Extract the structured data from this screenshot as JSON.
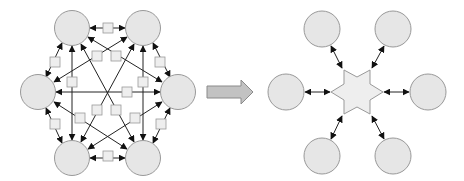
{
  "diagram": {
    "title": "",
    "colors": {
      "node_fill": "#e6e6e6",
      "node_stroke": "#999999",
      "edge": "#222222",
      "box_fill": "#eeeeee",
      "box_stroke": "#999999",
      "hub_fill": "#eeeeee",
      "arrow_fill": "#c2c2c2",
      "arrow_stroke": "#8a8a8a"
    },
    "left_panel": {
      "description": "Point-to-point mesh: 6 nodes, every pair connected by a bidirectional link with an intermediary box",
      "nodes": [
        {
          "id": "top-left",
          "x": 72,
          "y": 28
        },
        {
          "id": "top-right",
          "x": 143,
          "y": 28
        },
        {
          "id": "left",
          "x": 38,
          "y": 92
        },
        {
          "id": "right",
          "x": 178,
          "y": 92
        },
        {
          "id": "bottom-left",
          "x": 72,
          "y": 158
        },
        {
          "id": "bottom-right",
          "x": 143,
          "y": 158
        }
      ],
      "link_count": 15,
      "box_count": 15
    },
    "transition_arrow": {
      "direction": "right"
    },
    "right_panel": {
      "description": "Hub-and-spoke: 6 nodes each connected bidirectionally to a central six-pointed star hub",
      "hub": {
        "shape": "hexagram",
        "x": 357,
        "y": 92
      },
      "nodes": [
        {
          "id": "top-left",
          "x": 322,
          "y": 29
        },
        {
          "id": "top-right",
          "x": 393,
          "y": 29
        },
        {
          "id": "left",
          "x": 286,
          "y": 92
        },
        {
          "id": "right",
          "x": 428,
          "y": 92
        },
        {
          "id": "bottom-left",
          "x": 322,
          "y": 156
        },
        {
          "id": "bottom-right",
          "x": 393,
          "y": 156
        }
      ],
      "link_count": 6
    }
  }
}
